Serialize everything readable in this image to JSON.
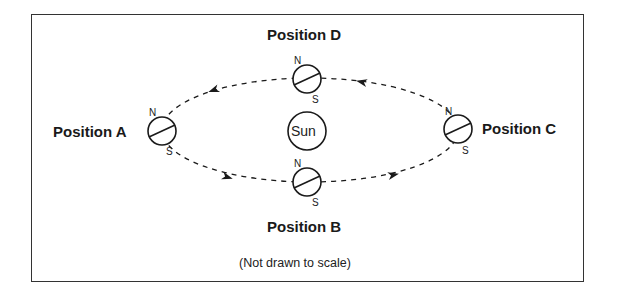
{
  "diagram": {
    "type": "earth-orbit",
    "center_body": {
      "label": "Sun"
    },
    "positions": [
      {
        "id": "A",
        "label": "Position A",
        "north": "N",
        "south": "S"
      },
      {
        "id": "B",
        "label": "Position B",
        "north": "N",
        "south": "S"
      },
      {
        "id": "C",
        "label": "Position C",
        "north": "N",
        "south": "S"
      },
      {
        "id": "D",
        "label": "Position D",
        "north": "N",
        "south": "S"
      }
    ],
    "orbit_direction": "A → B → C → D → A",
    "note": "(Not drawn to scale)",
    "colors": {
      "line": "#1a1a1a",
      "border": "#333333",
      "background": "#ffffff"
    }
  }
}
